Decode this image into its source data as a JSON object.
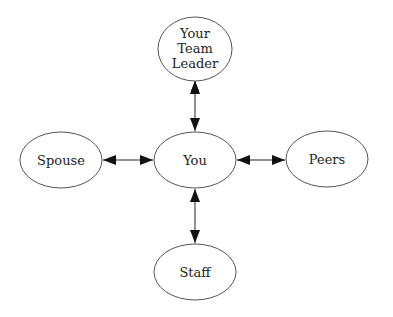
{
  "diagram": {
    "type": "hub-and-spoke relationship diagram",
    "nodes": [
      {
        "id": "leader",
        "label_lines": [
          "Your",
          "Team",
          "Leader"
        ],
        "cx": 195,
        "cy": 48,
        "rx": 37,
        "ry": 32
      },
      {
        "id": "you",
        "label_lines": [
          "You"
        ],
        "cx": 195,
        "cy": 160,
        "rx": 41,
        "ry": 28
      },
      {
        "id": "spouse",
        "label_lines": [
          "Spouse"
        ],
        "cx": 61,
        "cy": 160,
        "rx": 41,
        "ry": 28
      },
      {
        "id": "peers",
        "label_lines": [
          "Peers"
        ],
        "cx": 327,
        "cy": 159,
        "rx": 41,
        "ry": 28
      },
      {
        "id": "staff",
        "label_lines": [
          "Staff"
        ],
        "cx": 195,
        "cy": 272,
        "rx": 41,
        "ry": 28
      }
    ],
    "edges": [
      {
        "from": "you",
        "to": "leader",
        "direction": "bidirectional"
      },
      {
        "from": "you",
        "to": "spouse",
        "direction": "bidirectional"
      },
      {
        "from": "you",
        "to": "peers",
        "direction": "bidirectional"
      },
      {
        "from": "you",
        "to": "staff",
        "direction": "bidirectional"
      }
    ]
  },
  "labels": {
    "leader_1": "Your",
    "leader_2": "Team",
    "leader_3": "Leader",
    "you": "You",
    "spouse": "Spouse",
    "peers": "Peers",
    "staff": "Staff"
  },
  "colors": {
    "node_stroke": "#555555",
    "text": "#222222",
    "arrow": "#222222",
    "background": "#ffffff"
  }
}
